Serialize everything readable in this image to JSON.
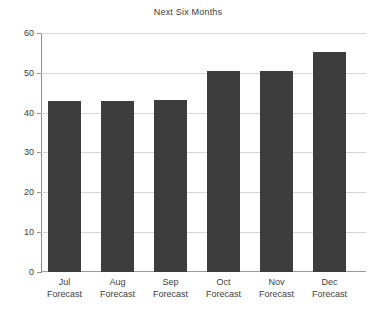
{
  "chart_data": {
    "type": "bar",
    "title": "Next Six Months",
    "xlabel": "",
    "ylabel": "",
    "ylim": [
      0,
      60
    ],
    "yticks": [
      0,
      10,
      20,
      30,
      40,
      50,
      60
    ],
    "grid": true,
    "legend": false,
    "categories": [
      "Jul Forecast",
      "Aug Forecast",
      "Sep Forecast",
      "Oct Forecast",
      "Nov Forecast",
      "Dec Forecast"
    ],
    "category_lines": [
      [
        "Jul",
        "Forecast"
      ],
      [
        "Aug",
        "Forecast"
      ],
      [
        "Sep",
        "Forecast"
      ],
      [
        "Oct",
        "Forecast"
      ],
      [
        "Nov",
        "Forecast"
      ],
      [
        "Dec",
        "Forecast"
      ]
    ],
    "values": [
      43,
      43,
      43.2,
      50.4,
      50.4,
      55.2
    ],
    "bar_color": "#3d3d3d",
    "gridline_color": "#d6d6d6",
    "axis_color": "#8e8e8e",
    "background_color": "#ffffff",
    "text_color": "#3d3d3d"
  }
}
